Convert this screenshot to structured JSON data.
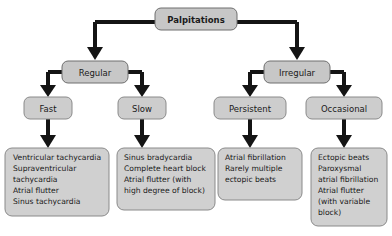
{
  "diagram": {
    "title": "Palpitations",
    "root": {
      "label": "Palpitations"
    },
    "level2": [
      {
        "label": "Regular"
      },
      {
        "label": "Irregular"
      }
    ],
    "level3": [
      {
        "label": "Fast"
      },
      {
        "label": "Slow"
      },
      {
        "label": "Persistent"
      },
      {
        "label": "Occasional"
      }
    ],
    "leaves": [
      {
        "name": "fast-causes",
        "lines": [
          "Ventricular tachycardia",
          "Supraventricular",
          "tachycardia",
          "Atrial flutter",
          "Sinus tachycardia"
        ]
      },
      {
        "name": "slow-causes",
        "lines": [
          "Sinus bradycardia",
          "Complete heart block",
          "Atrial flutter (with",
          "high degree of block)"
        ]
      },
      {
        "name": "persistent-causes",
        "lines": [
          "Atrial fibrillation",
          "Rarely multiple",
          "ectopic beats"
        ]
      },
      {
        "name": "occasional-causes",
        "lines": [
          "Ectopic beats",
          "Paroxysmal",
          "atrial fibrillation",
          "Atrial flutter",
          "(with variable",
          "block)"
        ]
      }
    ],
    "colors": {
      "background": "#ffffff",
      "node_fill": "#c7c7c7",
      "leaf_fill": "#d0d0d0",
      "node_border": "#6e6e6e",
      "connector": "#141414",
      "text": "#1a1a1a"
    }
  }
}
